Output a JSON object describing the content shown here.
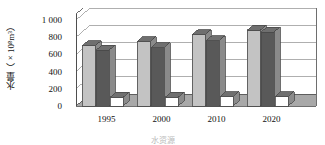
{
  "chart_data": {
    "type": "bar",
    "title": "",
    "subtitle": "",
    "ylabel": "水量（×10⁸m³）",
    "ylabel_main": "水量（×10",
    "ylabel_sup": "8",
    "ylabel_tail": "m³）",
    "xlabel": "水资源",
    "categories": [
      "1995",
      "2000",
      "2010",
      "2020"
    ],
    "ylim": [
      0,
      1000
    ],
    "yticks": [
      "1 000",
      "800",
      "600",
      "400",
      "200",
      "0"
    ],
    "ytick_values": [
      1000,
      800,
      600,
      400,
      200,
      0
    ],
    "grid": true,
    "legend": "none",
    "legend_position": "none",
    "style": "3d-clustered-column",
    "series": [
      {
        "name": "series-1",
        "color": "#c3c3c3",
        "values": [
          700,
          750,
          830,
          880
        ]
      },
      {
        "name": "series-2",
        "color": "#595959",
        "values": [
          650,
          680,
          760,
          860
        ]
      },
      {
        "name": "series-3",
        "color": "#ffffff",
        "values": [
          100,
          100,
          110,
          110
        ]
      }
    ]
  },
  "colors": {
    "series_light": "#c3c3c3",
    "series_dark": "#595959",
    "series_white": "#ffffff",
    "floor": "#a8a8a8",
    "wall": "#ffffff",
    "grid": "#8d8d8d",
    "outline": "#4a4a4a",
    "text": "#111111"
  }
}
